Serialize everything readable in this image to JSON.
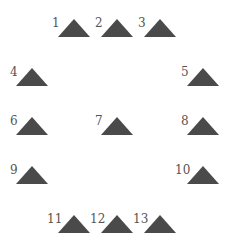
{
  "diagram": {
    "shape": "triangle",
    "fill_color": "#4a4a4a",
    "label_color": "#555555",
    "triangle_width": 33,
    "triangle_height": 18,
    "items": [
      {
        "label": "1",
        "tri_x": 58,
        "tri_y": 19,
        "label_x": 52,
        "label_y": 17
      },
      {
        "label": "2",
        "tri_x": 101,
        "tri_y": 19,
        "label_x": 95,
        "label_y": 17
      },
      {
        "label": "3",
        "tri_x": 144,
        "tri_y": 19,
        "label_x": 138,
        "label_y": 17
      },
      {
        "label": "4",
        "tri_x": 16,
        "tri_y": 68,
        "label_x": 10,
        "label_y": 66
      },
      {
        "label": "5",
        "tri_x": 187,
        "tri_y": 68,
        "label_x": 181,
        "label_y": 66
      },
      {
        "label": "6",
        "tri_x": 16,
        "tri_y": 117,
        "label_x": 10,
        "label_y": 115
      },
      {
        "label": "7",
        "tri_x": 101,
        "tri_y": 117,
        "label_x": 95,
        "label_y": 115
      },
      {
        "label": "8",
        "tri_x": 187,
        "tri_y": 117,
        "label_x": 181,
        "label_y": 115
      },
      {
        "label": "9",
        "tri_x": 16,
        "tri_y": 166,
        "label_x": 10,
        "label_y": 164
      },
      {
        "label": "10",
        "tri_x": 187,
        "tri_y": 166,
        "label_x": 175,
        "label_y": 164
      },
      {
        "label": "11",
        "tri_x": 58,
        "tri_y": 215,
        "label_x": 47,
        "label_y": 213
      },
      {
        "label": "12",
        "tri_x": 101,
        "tri_y": 215,
        "label_x": 90,
        "label_y": 213
      },
      {
        "label": "13",
        "tri_x": 144,
        "tri_y": 215,
        "label_x": 133,
        "label_y": 213
      }
    ]
  }
}
